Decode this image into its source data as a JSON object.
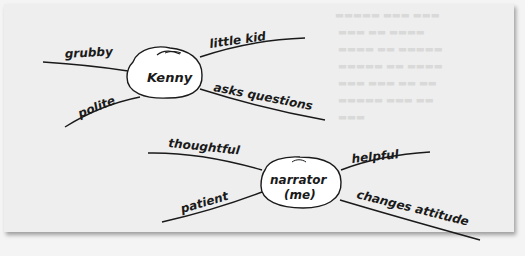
{
  "web_map_1": {
    "center": "Kenny",
    "traits": {
      "top_left": "grubby",
      "top_right": "little kid",
      "bottom_left": "polite",
      "bottom_right": "asks questions"
    }
  },
  "web_map_2": {
    "center_line1": "narrator",
    "center_line2": "(me)",
    "traits": {
      "top_left": "thoughtful",
      "top_right": "helpful",
      "bottom_left": "patient",
      "bottom_right": "changes attitude"
    }
  },
  "colors": {
    "paper": "#eeeeee",
    "ink": "#1a1a1a",
    "bubble": "#ffffff"
  }
}
